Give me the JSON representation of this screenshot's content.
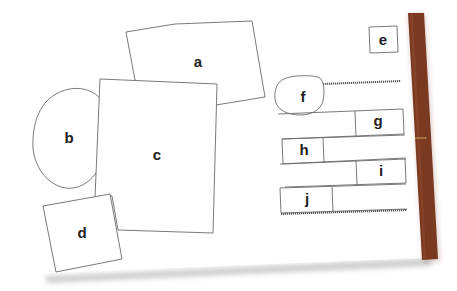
{
  "diagram": {
    "colors": {
      "page": "#ffffff",
      "shadow": "#d6d6d6",
      "spine": "#7a3a22",
      "spine_highlight": "#c7a15a",
      "outline": "#6b6b6b",
      "label": "#222222"
    },
    "labels": {
      "a": "a",
      "b": "b",
      "c": "c",
      "d": "d",
      "e": "e",
      "f": "f",
      "g": "g",
      "h": "h",
      "i": "i",
      "j": "j"
    }
  }
}
